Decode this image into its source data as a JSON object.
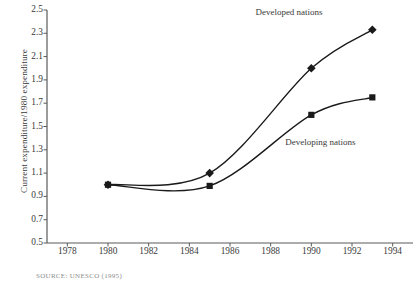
{
  "chart_data": {
    "type": "line",
    "title": "",
    "xlabel": "",
    "ylabel": "Current expenditure/1980 expenditure",
    "xlim": [
      1977,
      1995
    ],
    "ylim": [
      0.5,
      2.5
    ],
    "grid": false,
    "legend_position": "inline-annotation",
    "x_ticks": [
      "1978",
      "1980",
      "1982",
      "1984",
      "1986",
      "1988",
      "1990",
      "1992",
      "1994"
    ],
    "x_tick_values": [
      1978,
      1980,
      1982,
      1984,
      1986,
      1988,
      1990,
      1992,
      1994
    ],
    "y_ticks": [
      "0.5",
      "0.7",
      "0.9",
      "1.1",
      "1.3",
      "1.5",
      "1.7",
      "1.9",
      "2.1",
      "2.3",
      "2.5"
    ],
    "y_tick_values": [
      0.5,
      0.7,
      0.9,
      1.1,
      1.3,
      1.5,
      1.7,
      1.9,
      2.1,
      2.3,
      2.5
    ],
    "series": [
      {
        "name": "Developed nations",
        "marker": "diamond",
        "color": "#1a1a1a",
        "x": [
          1980,
          1985,
          1990,
          1993
        ],
        "values": [
          1.0,
          1.1,
          2.0,
          2.33
        ]
      },
      {
        "name": "Developing nations",
        "marker": "square",
        "color": "#1a1a1a",
        "x": [
          1980,
          1985,
          1990,
          1993
        ],
        "values": [
          1.0,
          0.99,
          1.6,
          1.75
        ]
      }
    ],
    "annotations": [
      {
        "text": "Developed nations",
        "x": 1990.2,
        "y": 2.47
      },
      {
        "text": "Developing nations",
        "x": 1989.8,
        "y": 1.36
      }
    ]
  },
  "figure": {
    "source_note": "SOURCE: UNESCO (1995)"
  }
}
